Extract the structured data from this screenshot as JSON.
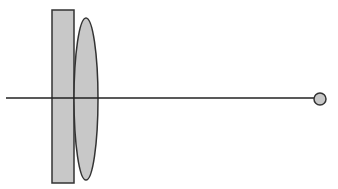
{
  "diagram": {
    "colors": {
      "background": "#ffffff",
      "fill": "#c8c8c8",
      "stroke": "#333333",
      "axis": "#222222"
    },
    "elements": {
      "plate": {
        "x": 52,
        "y": 10,
        "width": 22,
        "height": 173
      },
      "lens": {
        "cx": 86,
        "cy": 99,
        "rx": 12,
        "ry": 81
      },
      "axis": {
        "x1": 6,
        "y1": 98,
        "x2": 314,
        "y2": 98
      },
      "source": {
        "cx": 320,
        "cy": 99,
        "r": 6
      }
    }
  }
}
